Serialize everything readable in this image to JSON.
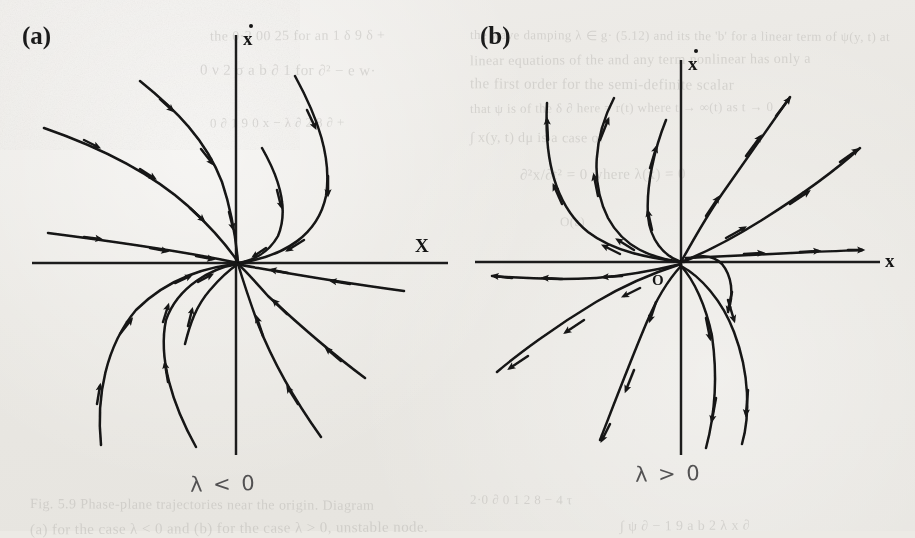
{
  "figure": {
    "kind": "phase-portrait-pair",
    "background_color": "#eceae5",
    "ink_color": "#141414",
    "panels": [
      {
        "id": "a",
        "label": "(a)",
        "caption": "λ < 0",
        "node_type": "stable node",
        "flow_direction": "inward",
        "origin_label": "",
        "x_axis_label": "X",
        "y_axis_label": "x",
        "y_axis_label_accent": "dot"
      },
      {
        "id": "b",
        "label": "(b)",
        "caption": "λ > 0",
        "node_type": "unstable node",
        "flow_direction": "outward",
        "origin_label": "O",
        "x_axis_label": "x",
        "y_axis_label": "x",
        "y_axis_label_accent": "dot"
      }
    ]
  },
  "chart_data": {
    "type": "line",
    "title": "",
    "xlabel": "X",
    "ylabel": "x-dot",
    "grid": false,
    "legend": null,
    "panels": [
      {
        "name": "(a) stable node, lambda < 0",
        "origin": [
          238,
          263
        ],
        "axes": {
          "x_axis": {
            "x1": 32,
            "x2": 448,
            "y": 263
          },
          "y_axis": {
            "x": 236,
            "y1": 35,
            "y2": 455
          }
        },
        "arrow_direction": "toward-origin",
        "trajectories": [
          {
            "id": "a-ul-1",
            "path": "M 140 81 C 176 110 206 140 222 182 C 232 212 236 240 238 262"
          },
          {
            "id": "a-ul-2",
            "path": "M 44 128 C 96 146 150 172 188 206 C 214 230 230 250 238 262"
          },
          {
            "id": "a-ul-3",
            "path": "M 48 233 C 110 241 170 250 208 257 C 224 260 233 262 238 263"
          },
          {
            "id": "a-ur-1",
            "path": "M 295 76 C 316 118 330 158 325 196 C 318 232 288 254 238 263"
          },
          {
            "id": "a-ur-2",
            "path": "M 264 147 C 282 180 288 212 278 236 C 268 254 252 261 238 263"
          },
          {
            "id": "a-lr-1",
            "path": "M 365 378 C 330 352 296 322 268 296 C 252 278 243 268 238 264"
          },
          {
            "id": "a-lr-2",
            "path": "M 321 437 C 296 402 273 362 258 324 C 248 296 241 274 238 264"
          },
          {
            "id": "a-ll-1",
            "path": "M 101 445 C 96 396 106 346 136 310 C 170 276 212 266 238 264"
          },
          {
            "id": "a-ll-2",
            "path": "M 196 447 C 172 404 158 358 166 320 C 178 286 212 268 238 264"
          },
          {
            "id": "a-lr-3",
            "path": "M 404 291 C 352 284 292 274 258 268 C 246 266 241 265 238 264"
          },
          {
            "id": "a-ll-3",
            "path": "M 185 344 C 190 324 196 306 210 290 C 222 276 232 268 238 264"
          }
        ]
      },
      {
        "name": "(b) unstable node, lambda > 0",
        "origin": [
          681,
          262
        ],
        "axes": {
          "x_axis": {
            "x1": 475,
            "x2": 880,
            "y": 262
          },
          "y_axis": {
            "x": 681,
            "y1": 60,
            "y2": 455
          }
        },
        "arrow_direction": "away-from-origin",
        "trajectories": [
          {
            "id": "b-ul-1",
            "path": "M 681 262 C 650 258 614 252 588 232 C 556 206 544 160 547 103"
          },
          {
            "id": "b-ul-2",
            "path": "M 681 262 C 650 258 622 246 606 216 C 588 180 592 134 613 98"
          },
          {
            "id": "b-ul-3",
            "path": "M 681 262 C 662 256 648 240 646 216 C 644 186 652 152 665 122"
          },
          {
            "id": "b-ur-1",
            "path": "M 681 262 C 692 248 706 222 724 196 C 748 160 772 124 790 97"
          },
          {
            "id": "b-ur-2",
            "path": "M 681 262 C 702 254 730 240 762 220 C 800 196 836 170 860 148"
          },
          {
            "id": "b-ur-3",
            "path": "M 686 258 C 724 256 772 254 812 252 C 840 251 856 250 862 250"
          },
          {
            "id": "b-ll-1",
            "path": "M 681 264 C 656 270 624 276 596 278 C 556 280 516 278 492 276"
          },
          {
            "id": "b-ll-2",
            "path": "M 681 264 C 656 272 626 284 596 302 C 556 326 518 354 497 372"
          },
          {
            "id": "b-ll-3",
            "path": "M 681 266 C 668 280 656 300 646 324 C 630 362 614 404 600 440"
          },
          {
            "id": "b-lr-1",
            "path": "M 681 266 C 694 280 706 306 712 336 C 718 378 714 418 706 448"
          },
          {
            "id": "b-lr-2",
            "path": "M 681 266 C 700 276 720 298 732 330 C 748 372 748 414 742 444"
          },
          {
            "id": "b-lr-3",
            "path": "M 681 264 C 694 256 710 254 722 262 C 734 272 736 292 730 312"
          }
        ]
      }
    ]
  },
  "ghost_text": {
    "note": "faint bleed-through of surrounding printed page text",
    "lines": [
      {
        "text": "the wave damping λ ∈ g· (5.12) and its the 'b' for a linear term of ψ(y, t) at",
        "x": 470,
        "y": 28
      },
      {
        "text": "linear equations of the and any term nonlinear has only a",
        "x": 470,
        "y": 52
      },
      {
        "text": "the first order for the semi-definite scalar",
        "x": 470,
        "y": 76
      },
      {
        "text": "that ψ is of the δ ∂ here = r(t) where t → ∞(t) as t → 0",
        "x": 470,
        "y": 100
      },
      {
        "text": "∫ x(y, t) dμ is a case of",
        "x": 470,
        "y": 130
      },
      {
        "text": "∂²x/∂t² = 0 where λ(x) = 0",
        "x": 520,
        "y": 166
      },
      {
        "text": "O(ε)",
        "x": 560,
        "y": 214
      },
      {
        "text": "the 0·2 00 25 for an 1 δ 9 δ +",
        "x": 210,
        "y": 28
      },
      {
        "text": "0 ν 2 σ a b ∂ 1 for ∂² − e w·",
        "x": 200,
        "y": 62
      },
      {
        "text": "0 ∂ 1 9 0 x − λ ∂ 2 8 ∂ +",
        "x": 210,
        "y": 115
      },
      {
        "text": "Fig. 5.9 Phase-plane trajectories near the origin. Diagram",
        "x": 30,
        "y": 497
      },
      {
        "text": "(a) for the case λ < 0 and (b) for the case λ > 0, unstable node.",
        "x": 30,
        "y": 520
      },
      {
        "text": "2·0 ∂ 0 1 2 8 − 4 τ",
        "x": 470,
        "y": 492
      },
      {
        "text": "∫ ψ ∂ − 1 9 a b 2 λ x ∂",
        "x": 620,
        "y": 518
      }
    ]
  }
}
